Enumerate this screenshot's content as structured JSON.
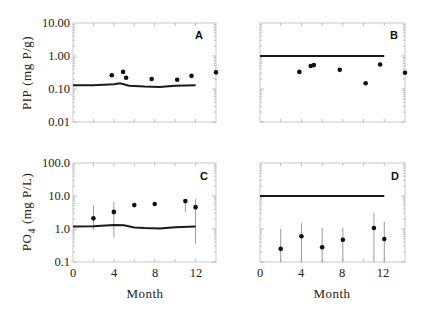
{
  "figure": {
    "x_axis_title": "Month",
    "panels": [
      {
        "id": "A",
        "ylabel_main": "PIP",
        "ylabel_unit": "(mg P/g)",
        "ytick_labels": [
          "10.00",
          "1.00",
          "0.10",
          "0.01"
        ]
      },
      {
        "id": "B"
      },
      {
        "id": "C",
        "ylabel_main": "PO",
        "ylabel_sub": "4",
        "ylabel_unit": "(mg P/L)",
        "ytick_labels": [
          "100.0",
          "10.0",
          "1.0",
          "0.1"
        ]
      },
      {
        "id": "D"
      }
    ],
    "xtick_labels": [
      "0",
      "4",
      "8",
      "12"
    ]
  },
  "chart_data": [
    {
      "panel": "A",
      "type": "scatter",
      "title": "",
      "xlabel": "",
      "ylabel": "PIP (mg P/g)",
      "yscale": "log",
      "xlim": [
        0,
        14
      ],
      "ylim": [
        0.01,
        10
      ],
      "grid": false,
      "series": [
        {
          "name": "observed",
          "kind": "points",
          "x": [
            3.8,
            4.9,
            5.2,
            7.7,
            10.2,
            11.6,
            14.0
          ],
          "y": [
            0.26,
            0.33,
            0.22,
            0.2,
            0.19,
            0.25,
            0.32
          ]
        },
        {
          "name": "model",
          "kind": "line",
          "x": [
            0,
            2,
            4,
            4.6,
            5.5,
            7,
            8.5,
            10,
            12
          ],
          "y": [
            0.13,
            0.13,
            0.14,
            0.15,
            0.125,
            0.118,
            0.115,
            0.125,
            0.13
          ]
        }
      ]
    },
    {
      "panel": "B",
      "type": "scatter",
      "yscale": "log",
      "xlim": [
        0,
        14
      ],
      "ylim": [
        0.01,
        10
      ],
      "grid": false,
      "series": [
        {
          "name": "observed",
          "kind": "points",
          "x": [
            3.8,
            4.9,
            5.2,
            7.7,
            10.2,
            11.6,
            14.0
          ],
          "y": [
            0.33,
            0.5,
            0.53,
            0.38,
            0.15,
            0.55,
            0.31
          ]
        },
        {
          "name": "model",
          "kind": "line",
          "x": [
            0,
            12
          ],
          "y": [
            1.0,
            1.0
          ]
        }
      ]
    },
    {
      "panel": "C",
      "type": "scatter",
      "xlabel": "Month",
      "ylabel": "PO4 (mg P/L)",
      "yscale": "log",
      "xlim": [
        0,
        14
      ],
      "ylim": [
        0.1,
        100
      ],
      "grid": false,
      "series": [
        {
          "name": "observed",
          "kind": "points",
          "x": [
            2,
            4,
            6,
            8,
            11,
            12
          ],
          "y": [
            2.1,
            3.3,
            5.3,
            5.7,
            7.0,
            4.6
          ],
          "err_low": [
            0.97,
            0.55,
            null,
            null,
            3.3,
            0.36
          ],
          "err_high": [
            5.2,
            6.6,
            null,
            null,
            7.4,
            8.0
          ]
        },
        {
          "name": "model",
          "kind": "line",
          "x": [
            0,
            2,
            4,
            5,
            6,
            7,
            8.5,
            10,
            12
          ],
          "y": [
            1.2,
            1.22,
            1.33,
            1.3,
            1.12,
            1.07,
            1.04,
            1.13,
            1.18
          ]
        }
      ]
    },
    {
      "panel": "D",
      "type": "scatter",
      "xlabel": "Month",
      "yscale": "log",
      "xlim": [
        0,
        14
      ],
      "ylim": [
        0.1,
        100
      ],
      "grid": false,
      "series": [
        {
          "name": "observed",
          "kind": "points",
          "x": [
            2,
            4,
            6,
            8,
            11,
            12
          ],
          "y": [
            0.25,
            0.6,
            0.28,
            0.47,
            1.07,
            0.5
          ],
          "err_low": [
            0.1,
            0.1,
            0.1,
            0.1,
            0.1,
            0.1
          ],
          "err_high": [
            1.0,
            1.5,
            1.1,
            1.1,
            3.1,
            1.65
          ]
        },
        {
          "name": "model",
          "kind": "line",
          "x": [
            0,
            12
          ],
          "y": [
            10.0,
            10.0
          ]
        }
      ]
    }
  ]
}
